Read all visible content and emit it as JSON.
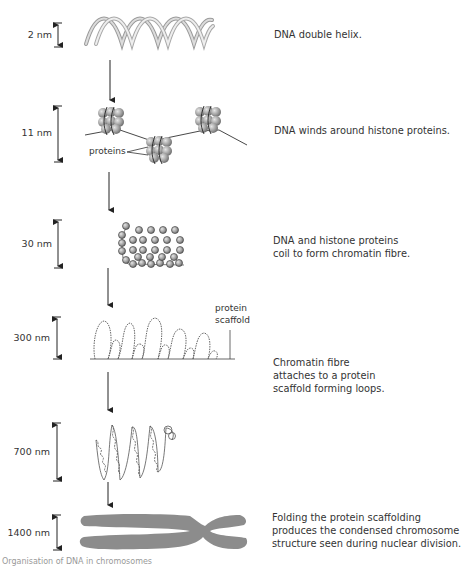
{
  "figure": {
    "title": "Organisation of DNA in chromosomes",
    "stages": [
      {
        "scale": "2 nm",
        "description_lines": [
          "DNA double helix."
        ],
        "structure": "dna-double-helix"
      },
      {
        "scale": "11 nm",
        "description_lines": [
          "DNA winds around histone proteins."
        ],
        "structure": "nucleosomes",
        "callout": "proteins"
      },
      {
        "scale": "30 nm",
        "description_lines": [
          "DNA and histone proteins",
          "coil to form chromatin fibre."
        ],
        "structure": "chromatin-fibre"
      },
      {
        "scale": "300 nm",
        "description_lines": [
          "Chromatin fibre",
          "attaches to a protein",
          "scaffold forming loops."
        ],
        "structure": "scaffold-loops",
        "callout_lines": [
          "protein",
          "scaffold"
        ]
      },
      {
        "scale": "700 nm",
        "description_lines": [],
        "structure": "coiled-loops"
      },
      {
        "scale": "1400 nm",
        "description_lines": [
          "Folding the protein scaffolding",
          "produces the condensed chromosome",
          "structure seen during nuclear division."
        ],
        "structure": "condensed-chromosome"
      }
    ],
    "caption": "Organisation of DNA in chromosomes"
  },
  "colors": {
    "text": "#333333",
    "helix": "#b8b8b8",
    "protein": "#9a9a9a",
    "chromosome": "#8c8c8c",
    "arrow": "#222222"
  }
}
